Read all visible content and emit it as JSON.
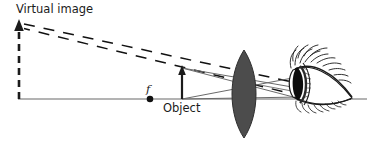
{
  "figure": {
    "type": "optics ray diagram",
    "width": 367,
    "height": 142,
    "background_color": "#ffffff"
  },
  "labels": {
    "virtual_image": "Virtual image",
    "object": "Object",
    "focal_point": "f"
  },
  "colors": {
    "ink": "#1b1b1b",
    "axis_gray": "#9a9a9a",
    "ray_gray": "#5e5e5e",
    "lens_fill": "#4c4c4c",
    "lens_stroke": "#2f2f2f",
    "dash_black": "#111111",
    "eye_ink": "#1a1a1a",
    "cornea_dark": "#0d0d0d"
  },
  "geometry": {
    "optical_axis": {
      "x1": 18,
      "y1": 99,
      "x2": 367,
      "y2": 99
    },
    "virtual_image_arrow": {
      "x": 19,
      "y_base": 99,
      "y_tip": 22,
      "style": "dashed-thick-with-solid-head"
    },
    "object_arrow": {
      "x": 182,
      "y_base": 99,
      "y_tip": 67,
      "style": "solid-thin-with-head"
    },
    "focal_point": {
      "x": 150,
      "y": 99,
      "radius": 3.2
    },
    "lens": {
      "cx": 244,
      "cy": 94,
      "half_width": 11,
      "top_y": 50,
      "bottom_y": 138
    },
    "eye": {
      "cx": 318,
      "cy": 84,
      "cornea_x": 297,
      "apex_x": 352
    },
    "dashed_ray_1": {
      "x1": 24,
      "y1": 25,
      "x2": 296,
      "y2": 84
    },
    "dashed_ray_2": {
      "x1": 24,
      "y1": 28,
      "x2": 300,
      "y2": 95
    },
    "solid_rays": [
      {
        "name": "ray-parallel-axis",
        "x1": 182,
        "y1": 68,
        "x2": 300,
        "y2": 90
      },
      {
        "name": "ray-through-center",
        "x1": 182,
        "y1": 68,
        "x2": 300,
        "y2": 96
      },
      {
        "name": "ray-axis-to-eye-upper",
        "x1": 182,
        "y1": 99,
        "x2": 302,
        "y2": 78
      },
      {
        "name": "ray-axis-to-eye-lower",
        "x1": 182,
        "y1": 99,
        "x2": 300,
        "y2": 98
      }
    ]
  }
}
